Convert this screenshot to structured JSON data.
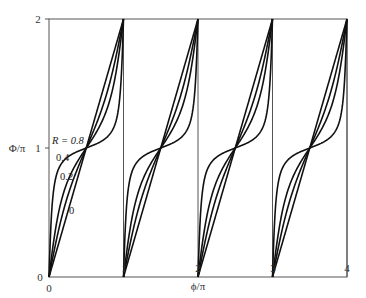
{
  "chart_data": {
    "type": "line",
    "title": "",
    "xlabel": "ϕ/π",
    "ylabel": "Φ/π",
    "xlim": [
      0,
      4
    ],
    "ylim": [
      0,
      2
    ],
    "xticks": [
      "0",
      "1",
      "2",
      "3",
      "4"
    ],
    "yticks": [
      "0",
      "1",
      "2"
    ],
    "grid": false,
    "vertical_lines_at": [
      1,
      2,
      3,
      4
    ],
    "function": "Phi/pi = 1 + (2/pi)*atan(((1-R)/(1+R))*tan(pi*((phi/pi mod 1)-0.5))), periodic, each period rising 0 to 2",
    "series": [
      {
        "name": "R = 0",
        "R": 0,
        "label": "0"
      },
      {
        "name": "R = 0.2",
        "R": 0.2,
        "label": "0.2"
      },
      {
        "name": "R = 0.4",
        "R": 0.4,
        "label": "0.4"
      },
      {
        "name": "R = 0.8",
        "R": 0.8,
        "label": "R = 0.8"
      }
    ],
    "crossing_points": [
      [
        0.5,
        1
      ],
      [
        1.5,
        1
      ],
      [
        2.5,
        1
      ],
      [
        3.5,
        1
      ]
    ],
    "legend": "inline labels in first period"
  },
  "axes": {
    "xlabel": "ϕ/π",
    "ylabel": "Φ/π",
    "xticks": [
      "0",
      "1",
      "2",
      "3",
      "4"
    ],
    "yticks": [
      "0",
      "1",
      "2"
    ]
  },
  "labels": {
    "r08": "R = 0.8",
    "r04": "0.4",
    "r02": "0.2",
    "r0": "0"
  }
}
